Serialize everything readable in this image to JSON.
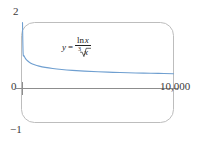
{
  "chart_data": {
    "type": "line",
    "title": "",
    "subtitle": "",
    "xlabel": "",
    "ylabel": "",
    "xlim": [
      0,
      10000
    ],
    "ylim": [
      -1,
      2
    ],
    "grid": false,
    "legend": null,
    "annotations": [
      {
        "name": "function-equation",
        "text": "y = ln x / cube-root(x)",
        "lhs": "y",
        "equals": "=",
        "numerator": "ln x",
        "denominator_index": "3",
        "denominator_radicand": "x",
        "x_position_data": 2900,
        "y_position_data": 1.28
      }
    ],
    "y_ticks": [
      {
        "value": 2,
        "label": "2"
      },
      {
        "value": 0,
        "label": "0"
      },
      {
        "value": -1,
        "label": "−1"
      }
    ],
    "x_ticks": [
      {
        "value": 10000,
        "label": "10,000"
      }
    ],
    "series": [
      {
        "name": "y = ln x / x^(1/3)",
        "color": "#6f9fd0",
        "x": [
          0,
          40,
          100,
          200,
          350,
          550,
          800,
          1100,
          1500,
          2000,
          2600,
          3300,
          4100,
          5000,
          6000,
          7000,
          8000,
          9000,
          10000
        ],
        "y": [
          2.0,
          1.08,
          0.99,
          0.906,
          0.833,
          0.768,
          0.719,
          0.678,
          0.639,
          0.604,
          0.574,
          0.548,
          0.526,
          0.507,
          0.49,
          0.477,
          0.466,
          0.457,
          0.449
        ]
      }
    ],
    "asymptote_note": "curve decays toward 0 as x increases"
  },
  "style": {
    "curve_color": "#6f9fd0",
    "axis_color": "#8d8d8d",
    "frame_color": "#b9b9b9",
    "text_color": "#2a2a2a",
    "background": "#ffffff"
  }
}
